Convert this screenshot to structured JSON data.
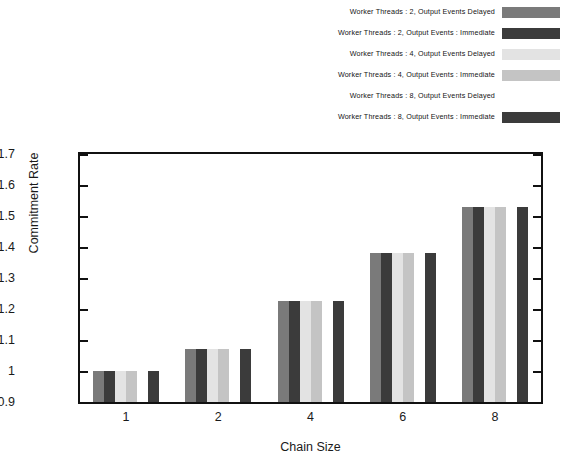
{
  "chart_data": {
    "type": "bar",
    "title": "",
    "xlabel": "Chain Size",
    "ylabel": "Commitment Rate",
    "categories": [
      "1",
      "2",
      "4",
      "6",
      "8"
    ],
    "ylim": [
      0.9,
      1.7
    ],
    "yticks": [
      0.9,
      1.0,
      1.1,
      1.2,
      1.3,
      1.4,
      1.5,
      1.6,
      1.7
    ],
    "ytick_labels": [
      "0.9",
      "1",
      "1.1",
      "1.2",
      "1.3",
      "1.4",
      "1.5",
      "1.6",
      "1.7"
    ],
    "grid": false,
    "legend_position": "top-right",
    "series": [
      {
        "name": "Worker Threads : 2, Output Events   Delayed",
        "color": "#7a7a7a",
        "values": [
          1.0,
          1.07,
          1.225,
          1.38,
          1.53
        ]
      },
      {
        "name": "Worker Threads : 2, Output Events : Immediate",
        "color": "#3b3b3b",
        "values": [
          1.0,
          1.07,
          1.225,
          1.38,
          1.53
        ]
      },
      {
        "name": "Worker Threads : 4, Output Events   Delayed",
        "color": "#e3e3e3",
        "values": [
          1.0,
          1.07,
          1.225,
          1.38,
          1.53
        ]
      },
      {
        "name": "Worker Threads : 4, Output Events : Immediate",
        "color": "#c4c4c4",
        "values": [
          1.0,
          1.07,
          1.225,
          1.38,
          1.53
        ]
      },
      {
        "name": "Worker Threads : 8, Output Events   Delayed",
        "color": "#ffffff",
        "values": [
          1.0,
          1.07,
          1.225,
          1.38,
          1.53
        ]
      },
      {
        "name": "Worker Threads : 8, Output Events : Immediate",
        "color": "#3b3b3b",
        "values": [
          1.0,
          1.07,
          1.225,
          1.38,
          1.53
        ]
      }
    ]
  }
}
